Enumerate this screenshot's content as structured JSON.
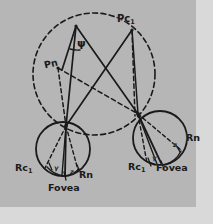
{
  "figure": {
    "background_color": "#b6b6b6",
    "ink_color": "#1a1a1a",
    "canvas": {
      "width": 213,
      "height": 224
    },
    "plate": {
      "width": 196,
      "height": 207
    }
  },
  "labels": {
    "pc1": "Pc",
    "pc1_sub": "1",
    "pn": "Pn",
    "psi": "ψ",
    "left_eye": {
      "rc1": "Rc",
      "rc1_sub": "1",
      "rn": "Rn",
      "fovea": "Fovea",
      "gamma": "γ",
      "z": "z"
    },
    "right_eye": {
      "rc1": "Rc",
      "rc1_sub": "1",
      "rn": "Rn",
      "fovea": "Fovea",
      "gamma": "γ",
      "z": "z"
    }
  },
  "geometry": {
    "horopter_circle": {
      "cx": 94,
      "cy": 74,
      "r": 61,
      "style": "dashed"
    },
    "left_eye_circle": {
      "cx": 63,
      "cy": 149,
      "r": 27,
      "style": "solid"
    },
    "right_eye_circle": {
      "cx": 160,
      "cy": 138,
      "r": 27,
      "style": "solid"
    },
    "points": {
      "apex": {
        "x": 76,
        "y": 26
      },
      "pc1": {
        "x": 132,
        "y": 30
      },
      "pn": {
        "x": 58,
        "y": 68
      },
      "left_nodal": {
        "x": 66,
        "y": 126
      },
      "right_nodal": {
        "x": 138,
        "y": 114
      }
    }
  }
}
